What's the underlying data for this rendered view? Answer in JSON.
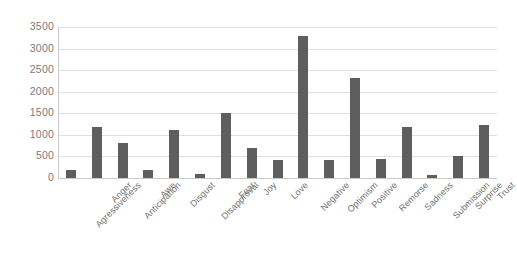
{
  "chart_data": {
    "type": "bar",
    "title": "",
    "subtitle": "",
    "xlabel": "",
    "ylabel": "",
    "ylim": [
      0,
      3500
    ],
    "ytick_labels": [
      "3500",
      "3000",
      "2500",
      "2000",
      "1500",
      "1000",
      "500",
      "0"
    ],
    "ytick_values": [
      3500,
      3000,
      2500,
      2000,
      1500,
      1000,
      500,
      0
    ],
    "ytick_interval": 500,
    "grid": true,
    "grid_axis": "y",
    "legend": false,
    "legend_position": "none",
    "bar_color": "#5e5e5e",
    "gridline_color": "#dfdfdf",
    "axis_color": "#c9c9c9",
    "label_color": "#6f6f6f",
    "xtick_rotation_degrees": -45,
    "categories": [
      "Agressiveness",
      "Anger",
      "Anticipation",
      "Awe",
      "Disgust",
      "Disapproval",
      "Fear",
      "Joy",
      "Love",
      "Negative",
      "Optimism",
      "Positive",
      "Remorse",
      "Sadness",
      "Submission",
      "Surprise",
      "Trust"
    ],
    "values": [
      180,
      1180,
      810,
      190,
      1110,
      90,
      1510,
      700,
      420,
      3300,
      410,
      2320,
      440,
      1180,
      80,
      520,
      1220
    ],
    "series": [
      {
        "name": "Count",
        "values": [
          180,
          1180,
          810,
          190,
          1110,
          90,
          1510,
          700,
          420,
          3300,
          410,
          2320,
          440,
          1180,
          80,
          520,
          1220
        ]
      }
    ]
  }
}
